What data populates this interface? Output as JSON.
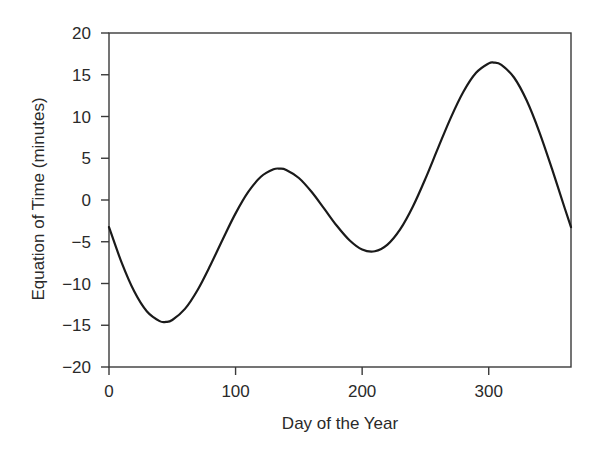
{
  "chart_data": {
    "type": "line",
    "title": "",
    "xlabel": "Day of the Year",
    "ylabel": "Equation of Time (minutes)",
    "xlim": [
      0,
      365
    ],
    "ylim": [
      -20,
      20
    ],
    "xticks": [
      0,
      100,
      200,
      300
    ],
    "xtick_labels": [
      "0",
      "100",
      "200",
      "300"
    ],
    "yticks": [
      20,
      15,
      10,
      5,
      0,
      -5,
      -10,
      -15,
      -20
    ],
    "ytick_labels": [
      "20",
      "15",
      "10",
      "5",
      "0",
      "−5",
      "−10",
      "−15",
      "−20"
    ],
    "grid": false,
    "legend": null,
    "series": [
      {
        "name": "Equation of Time",
        "color": "#1a1a1a",
        "x": [
          0,
          10,
          20,
          30,
          40,
          45,
          50,
          60,
          70,
          80,
          90,
          100,
          110,
          120,
          130,
          135,
          140,
          150,
          160,
          170,
          180,
          190,
          200,
          210,
          220,
          230,
          240,
          250,
          260,
          270,
          280,
          290,
          300,
          304,
          310,
          320,
          330,
          340,
          350,
          360,
          365
        ],
        "y": [
          -3.25,
          -7.5,
          -10.97,
          -13.36,
          -14.51,
          -14.6,
          -14.37,
          -13.04,
          -10.77,
          -7.84,
          -4.66,
          -1.6,
          0.97,
          2.78,
          3.67,
          3.75,
          3.6,
          2.64,
          0.99,
          -1.03,
          -3.09,
          -4.82,
          -5.93,
          -6.14,
          -5.35,
          -3.53,
          -0.81,
          2.56,
          6.24,
          9.84,
          12.96,
          15.23,
          16.36,
          16.46,
          16.19,
          14.67,
          11.91,
          8.14,
          3.72,
          -0.96,
          -3.25
        ]
      }
    ],
    "annotations": []
  },
  "colors": {
    "axis": "#3a3a3a",
    "line": "#1a1a1a",
    "text": "#2a2a2a"
  }
}
